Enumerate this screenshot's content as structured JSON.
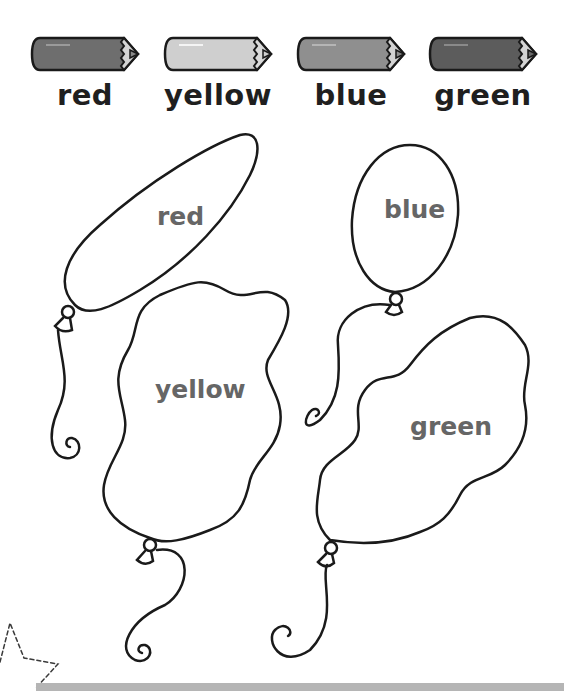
{
  "pencils": [
    {
      "label": "red",
      "body_color": "#6e6e6e",
      "tip_color": "#8a8a8a"
    },
    {
      "label": "yellow",
      "body_color": "#cfcfcf",
      "tip_color": "#cfcfcf"
    },
    {
      "label": "blue",
      "body_color": "#8f8f8f",
      "tip_color": "#8f8f8f"
    },
    {
      "label": "green",
      "body_color": "#5c5c5c",
      "tip_color": "#6a6a6a"
    }
  ],
  "balloons": [
    {
      "label": "red"
    },
    {
      "label": "yellow"
    },
    {
      "label": "blue"
    },
    {
      "label": "green"
    }
  ],
  "colors": {
    "outline": "#1a1a1a",
    "label_text": "#666666",
    "bar": "#b5b5b5"
  }
}
